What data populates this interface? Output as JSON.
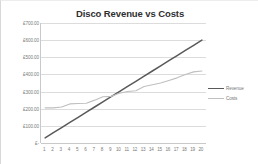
{
  "chart_data": {
    "type": "line",
    "title": "Disco Revenue vs Costs",
    "xlabel": "",
    "ylabel": "",
    "x": [
      1,
      2,
      3,
      4,
      5,
      6,
      7,
      8,
      9,
      10,
      11,
      12,
      13,
      14,
      15,
      16,
      17,
      18,
      19,
      20
    ],
    "xticklabels": [
      "1",
      "2",
      "3",
      "4",
      "5",
      "6",
      "7",
      "8",
      "9",
      "10",
      "11",
      "12",
      "13",
      "14",
      "15",
      "16",
      "17",
      "18",
      "19",
      "20"
    ],
    "ylim": [
      0,
      700
    ],
    "yticks": [
      0,
      100,
      200,
      300,
      400,
      500,
      600,
      700
    ],
    "yticklabels": [
      "£-",
      "£100.00",
      "£200.00",
      "£300.00",
      "£400.00",
      "£500.00",
      "£600.00",
      "£700.00"
    ],
    "grid": true,
    "legend_position": "right",
    "series": [
      {
        "name": "Revenue",
        "color": "#595959",
        "values": [
          30,
          60,
          90,
          120,
          150,
          180,
          210,
          240,
          270,
          300,
          330,
          360,
          390,
          420,
          450,
          480,
          510,
          540,
          570,
          600
        ]
      },
      {
        "name": "Costs",
        "color": "#bfbfbf",
        "values": [
          205,
          205,
          210,
          228,
          230,
          232,
          250,
          270,
          272,
          290,
          300,
          305,
          330,
          340,
          350,
          365,
          380,
          400,
          415,
          420
        ]
      }
    ]
  },
  "legend": {
    "entries": [
      {
        "label": "Revenue"
      },
      {
        "label": "Costs"
      }
    ]
  },
  "colors": {
    "revenue": "#595959",
    "costs": "#bfbfbf",
    "gridline": "#dcdcdc",
    "axis": "#c9c9c9",
    "title_text": "#2f2f2f",
    "tick_text": "#7a7a7a",
    "background": "#ffffff"
  }
}
